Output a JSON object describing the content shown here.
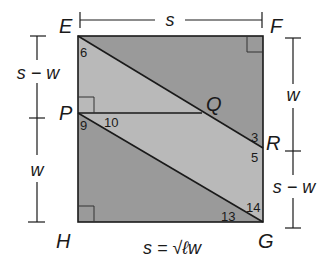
{
  "diagram": {
    "type": "geometry-square",
    "colors": {
      "dark_region": "#9a9a9a",
      "light_region": "#b9b9b9",
      "stroke": "#1a1a1a",
      "background": "#ffffff"
    },
    "vertices": {
      "E": "E",
      "F": "F",
      "G": "G",
      "H": "H",
      "P": "P",
      "Q": "Q",
      "R": "R"
    },
    "angles": {
      "a3": "3",
      "a5": "5",
      "a6": "6",
      "a9": "9",
      "a10": "10",
      "a13": "13",
      "a14": "14"
    },
    "dimensions": {
      "top": "s",
      "left_upper": "s − w",
      "left_lower": "w",
      "right_upper": "w",
      "right_lower": "s − w",
      "bottom": "s = √ℓw"
    }
  }
}
